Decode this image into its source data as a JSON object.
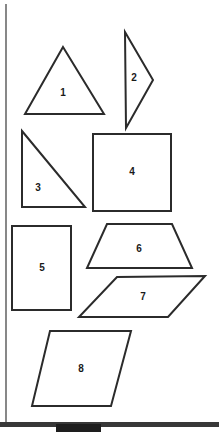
{
  "page": {
    "background_color": "#ffffff",
    "stroke_color": "#2b2b2b",
    "label_color": "#1a1a1a",
    "width": 219,
    "height": 432
  },
  "margin_rule": {
    "name": "left-margin-line",
    "color": "#555555",
    "x": 6,
    "y1": 4,
    "y2": 424
  },
  "shapes": [
    {
      "label": "1",
      "kind": "triangle",
      "description": "equilateral triangle",
      "points": "63,47 104,114 25,114",
      "label_x": 63,
      "label_y": 93
    },
    {
      "label": "2",
      "kind": "triangle",
      "description": "narrow triangle pointing right",
      "points": "125,32 153,80 126,128",
      "label_x": 134,
      "label_y": 78
    },
    {
      "label": "3",
      "kind": "triangle",
      "description": "right triangle",
      "points": "22,131 85,207 22,207",
      "label_x": 38,
      "label_y": 188
    },
    {
      "label": "4",
      "kind": "square",
      "description": "square",
      "points": "93,134 171,134 171,211 93,211",
      "label_x": 132,
      "label_y": 172
    },
    {
      "label": "5",
      "kind": "rectangle",
      "description": "upright rectangle",
      "points": "12,226 71,226 71,310 12,310",
      "label_x": 42,
      "label_y": 268
    },
    {
      "label": "6",
      "kind": "trapezoid",
      "description": "isosceles trapezoid",
      "points": "107,224 172,224 192,268 87,268",
      "label_x": 139,
      "label_y": 249
    },
    {
      "label": "7",
      "kind": "parallelogram",
      "description": "flat parallelogram",
      "points": "117,277 205,276 168,317 79,317",
      "label_x": 143,
      "label_y": 297
    },
    {
      "label": "8",
      "kind": "parallelogram",
      "description": "tall parallelogram",
      "points": "50,331 131,331 111,406 32,406",
      "label_x": 81,
      "label_y": 369
    }
  ],
  "scan_artifact": {
    "strip_name": "scan-edge-strip",
    "block_name": "scan-edge-block",
    "color": "#2f2f2f"
  }
}
